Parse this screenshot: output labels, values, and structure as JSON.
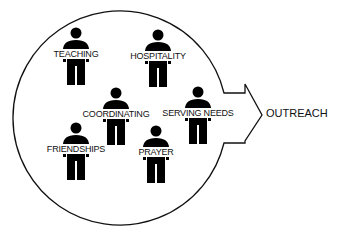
{
  "diagram": {
    "type": "group-to-outreach",
    "target_label": "OUTREACH",
    "figures": [
      {
        "label": "TEACHING",
        "x": 76,
        "y": 28
      },
      {
        "label": "HOSPITALITY",
        "x": 158,
        "y": 30
      },
      {
        "label": "COORDINATING",
        "x": 116,
        "y": 88
      },
      {
        "label": "SERVING NEEDS",
        "x": 198,
        "y": 87
      },
      {
        "label": "FRIENDSHIPS",
        "x": 76,
        "y": 123
      },
      {
        "label": "PRAYER",
        "x": 156,
        "y": 126
      }
    ],
    "colors": {
      "stroke": "#111111",
      "figure": "#000000",
      "background": "#ffffff"
    }
  }
}
